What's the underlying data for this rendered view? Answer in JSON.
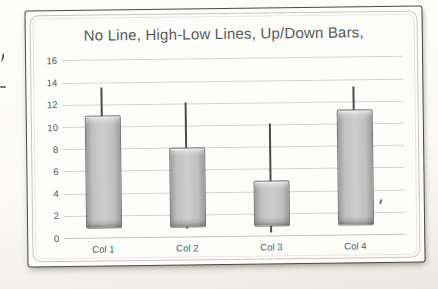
{
  "page": {
    "background_color": "#fbfaf7"
  },
  "style": {
    "title_color": "#595959",
    "axis_label_color": "#595959",
    "gridline_color": "#d6d3cf",
    "axis_line_color": "#c3c0bb",
    "highlow_line_color": "#4d4d4d",
    "bar_fill": "#c0c0c0",
    "bar_fill_light": "#cdcdcd",
    "bar_fill_dark": "#9c9c9c",
    "bar_border": "#767676",
    "frame_border_color": "#4a4a4a",
    "inner_border_color": "#c9c6c1"
  },
  "chart_data": {
    "type": "bar",
    "subtype": "up-down-bars-with-high-low-lines",
    "title": "No Line, High-Low Lines, Up/Down Bars,",
    "categories": [
      "Col 1",
      "Col 2",
      "Col 3",
      "Col 4"
    ],
    "series": [
      {
        "name": "bar-top",
        "values": [
          11,
          8,
          5,
          11.3
        ]
      },
      {
        "name": "bar-bottom",
        "values": [
          1,
          1,
          1,
          1
        ]
      },
      {
        "name": "high",
        "values": [
          13.5,
          12.1,
          10.1,
          13.3
        ]
      },
      {
        "name": "low",
        "values": [
          1,
          0.7,
          0.3,
          1
        ]
      }
    ],
    "xlabel": "",
    "ylabel": "",
    "ylim": [
      0,
      16
    ],
    "ytick_step": 2,
    "yticks": [
      "0",
      "2",
      "4",
      "6",
      "8",
      "10",
      "12",
      "14",
      "16"
    ],
    "grid": true,
    "legend": "none"
  }
}
